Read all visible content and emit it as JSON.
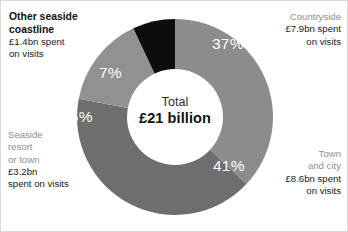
{
  "chart_data": {
    "type": "pie",
    "variant": "donut",
    "title": "",
    "subtitle": "",
    "xlabel": "",
    "ylabel": "",
    "total_label": "Total",
    "total_value": "£21 billion",
    "total_numeric": 21,
    "units": "£ billion",
    "legend": "none",
    "grid": false,
    "categories": [
      "Countryside",
      "Town and city",
      "Seaside resort or town",
      "Other seaside coastline"
    ],
    "values": [
      7.9,
      8.6,
      3.2,
      1.4
    ],
    "percentages": [
      37,
      41,
      15,
      7
    ],
    "percent_labels": [
      "37%",
      "41%",
      "15%",
      "7%"
    ],
    "colors": [
      "#8c8c8c",
      "#6e6e6e",
      "#919191",
      "#0d0d0d"
    ],
    "slices": [
      {
        "name": "Countryside",
        "value": 7.9,
        "percent": 37,
        "percent_label": "37%",
        "amount_label": "£7.9bn spent",
        "amount_label_line2": "on visits",
        "color": "#8c8c8c",
        "start_angle": 0,
        "end_angle": 133.2
      },
      {
        "name": "Town and city",
        "value": 8.6,
        "percent": 41,
        "percent_label": "41%",
        "amount_label": "£8.6bn spent",
        "amount_label_line2": "on visits",
        "color": "#6e6e6e",
        "start_angle": 133.2,
        "end_angle": 280.8
      },
      {
        "name": "Seaside resort or town",
        "value": 3.2,
        "percent": 15,
        "percent_label": "15%",
        "amount_label": "£3.2bn",
        "amount_label_line2": "spent  on visits",
        "color": "#919191",
        "start_angle": 280.8,
        "end_angle": 334.8
      },
      {
        "name": "Other seaside coastline",
        "value": 1.4,
        "percent": 7,
        "percent_label": "7%",
        "amount_label": "£1.4bn spent",
        "amount_label_line2": "on visits",
        "color": "#0d0d0d",
        "start_angle": 334.8,
        "end_angle": 360
      }
    ]
  },
  "center": {
    "total_label": "Total",
    "total_value": "£21 billion"
  },
  "percent_labels": {
    "countryside": "37%",
    "town": "41%",
    "seaside": "15%",
    "other": "7%"
  },
  "callouts": {
    "countryside": {
      "category": "Countryside",
      "line1": "£7.9bn spent",
      "line2": "on visits"
    },
    "town": {
      "category_line1": "Town",
      "category_line2": "and city",
      "line1": "£8.6bn spent",
      "line2": "on visits"
    },
    "seaside": {
      "category_line1": "Seaside",
      "category_line2": "resort",
      "category_line3": "or town",
      "line1": "£3.2bn",
      "line2": "spent  on visits"
    },
    "other": {
      "category_line1": "Other seaside",
      "category_line2": "coastline",
      "line1": "£1.4bn spent",
      "line2": "on visits"
    }
  }
}
